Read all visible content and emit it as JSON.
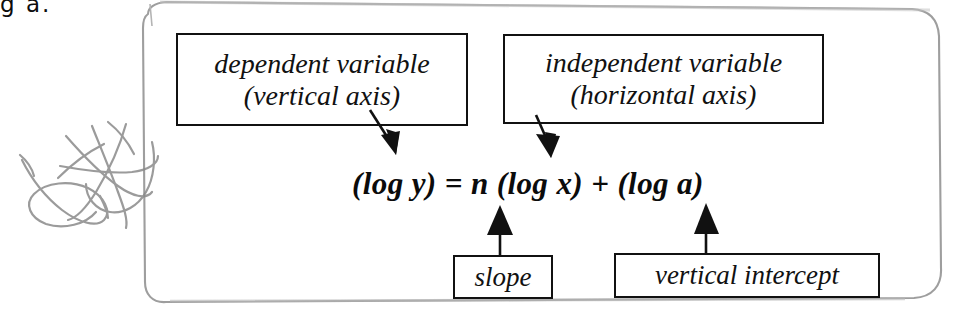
{
  "page": {
    "width": 956,
    "height": 313,
    "background": "#ffffff",
    "ink_color": "#111111",
    "frame_color": "#9a9a9a",
    "scribble_color": "#8d8d8d",
    "clipped_text_top_left": "g a."
  },
  "equation": {
    "full_text": "(log y) = n (log x) + (log a)",
    "terms": {
      "left_side": "(log y)",
      "equals": "=",
      "coefficient": "n",
      "x_term": "(log x)",
      "plus": "+",
      "intercept_term": "(log a)"
    }
  },
  "callouts": [
    {
      "id": "dependent",
      "line1": "dependent variable",
      "line2": "(vertical axis)",
      "points_to": "log y",
      "arrow_direction": "down-right"
    },
    {
      "id": "independent",
      "line1": "independent variable",
      "line2": "(horizontal axis)",
      "points_to": "log x",
      "arrow_direction": "down"
    },
    {
      "id": "slope",
      "line1": "slope",
      "line2": "",
      "points_to": "n",
      "arrow_direction": "up"
    },
    {
      "id": "intercept",
      "line1": "vertical intercept",
      "line2": "",
      "points_to": "log a",
      "arrow_direction": "up"
    }
  ]
}
